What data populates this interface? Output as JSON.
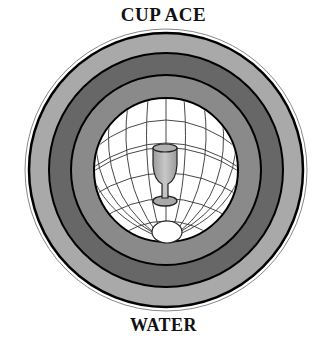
{
  "card": {
    "title": "CUP ACE",
    "element": "WATER"
  },
  "emblem": {
    "center": [
      166,
      170
    ],
    "rings": [
      {
        "name": "outer-band",
        "color": "#a9a9a9",
        "outer_radius": 137,
        "inner_radius": 117
      },
      {
        "name": "middle-band",
        "color": "#676767",
        "outer_radius": 117,
        "inner_radius": 95
      },
      {
        "name": "inner-band",
        "color": "#8a8a8a",
        "outer_radius": 95,
        "inner_radius": 72
      }
    ],
    "globe": {
      "color": "#ffffff",
      "radius": 72,
      "line_color": "#333333"
    },
    "symbol": "goblet"
  }
}
